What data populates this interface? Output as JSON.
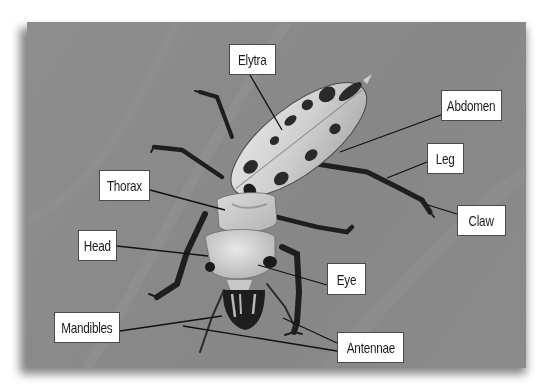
{
  "diagram": {
    "background_color": "#8a8a8a",
    "label_bg": "#ffffff",
    "label_border": "#4a4a4a",
    "label_text_color": "#1b1b1b",
    "leader_color": "#111111",
    "labels": [
      {
        "id": "elytra",
        "text": "Elytra",
        "box": {
          "x": 229,
          "y": 44,
          "w": 47,
          "h": 31
        },
        "points_to": [
          [
            282,
            130
          ]
        ]
      },
      {
        "id": "abdomen",
        "text": "Abdomen",
        "box": {
          "x": 441,
          "y": 90,
          "w": 61,
          "h": 31
        },
        "points_to": [
          [
            340,
            152
          ]
        ]
      },
      {
        "id": "leg",
        "text": "Leg",
        "box": {
          "x": 427,
          "y": 143,
          "w": 37,
          "h": 31
        },
        "points_to": [
          [
            387,
            178
          ]
        ]
      },
      {
        "id": "claw",
        "text": "Claw",
        "box": {
          "x": 457,
          "y": 205,
          "w": 49,
          "h": 31
        },
        "points_to": [
          [
            428,
            205
          ]
        ]
      },
      {
        "id": "thorax",
        "text": "Thorax",
        "box": {
          "x": 99,
          "y": 170,
          "w": 51,
          "h": 31
        },
        "points_to": [
          [
            225,
            210
          ]
        ]
      },
      {
        "id": "head",
        "text": "Head",
        "box": {
          "x": 78,
          "y": 230,
          "w": 39,
          "h": 31
        },
        "points_to": [
          [
            208,
            256
          ]
        ]
      },
      {
        "id": "eye",
        "text": "Eye",
        "box": {
          "x": 327,
          "y": 263,
          "w": 39,
          "h": 32
        },
        "points_to": [
          [
            258,
            265
          ]
        ]
      },
      {
        "id": "mandibles",
        "text": "Mandibles",
        "box": {
          "x": 54,
          "y": 312,
          "w": 66,
          "h": 31
        },
        "points_to": [
          [
            222,
            326
          ]
        ]
      },
      {
        "id": "antennae",
        "text": "Antennae",
        "box": {
          "x": 337,
          "y": 332,
          "w": 67,
          "h": 31
        },
        "points_to": [
          [
            283,
            318
          ],
          [
            183,
            326
          ]
        ]
      }
    ]
  }
}
